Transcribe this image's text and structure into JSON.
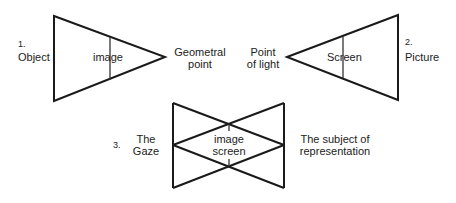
{
  "colors": {
    "stroke": "#1a1a1a",
    "text": "#222222",
    "background": "#ffffff"
  },
  "figure1": {
    "number": "1.",
    "left_label": "Object",
    "inner_label": "image",
    "right_label_line1": "Geometral",
    "right_label_line2": "point"
  },
  "figure2": {
    "number": "2.",
    "left_label_line1": "Point",
    "left_label_line2": "of light",
    "inner_label": "Screen",
    "right_label": "Picture"
  },
  "figure3": {
    "number": "3.",
    "left_label_line1": "The",
    "left_label_line2": "Gaze",
    "inner_label_line1": "image",
    "inner_label_line2": "screen",
    "right_label_line1": "The subject of",
    "right_label_line2": "representation"
  }
}
